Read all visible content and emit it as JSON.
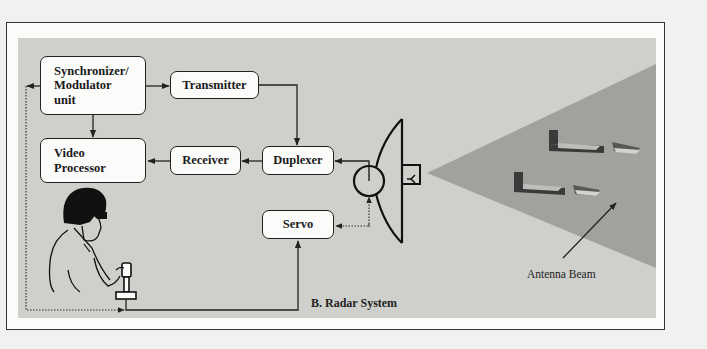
{
  "diagram": {
    "title": "B. Radar System",
    "blocks": {
      "synchronizer": "Synchronizer/\nModulator\nunit",
      "transmitter": "Transmitter",
      "video_processor": "Video\nProcessor",
      "receiver": "Receiver",
      "duplexer": "Duplexer",
      "servo": "Servo"
    },
    "annotations": {
      "antenna_beam": "Antenna Beam"
    },
    "connections": [
      {
        "from": "Synchronizer/Modulator unit",
        "to": "Transmitter",
        "style": "solid"
      },
      {
        "from": "Synchronizer/Modulator unit",
        "to": "Video Processor",
        "style": "solid"
      },
      {
        "from": "Transmitter",
        "to": "Duplexer",
        "style": "solid"
      },
      {
        "from": "Duplexer",
        "to": "Receiver",
        "style": "solid"
      },
      {
        "from": "Receiver",
        "to": "Video Processor",
        "style": "solid"
      },
      {
        "from": "Antenna",
        "to": "Duplexer",
        "style": "solid"
      },
      {
        "from": "Antenna",
        "to": "Servo",
        "style": "dotted"
      },
      {
        "from": "Joystick",
        "to": "Servo",
        "style": "solid"
      },
      {
        "from": "Synchronizer/Modulator unit",
        "to": "Joystick",
        "style": "dotted"
      }
    ],
    "colors": {
      "panel": "#cfcfcc",
      "beam": "#9e9e9b",
      "box_fill": "#fbfbfa",
      "stroke": "#222222"
    }
  }
}
